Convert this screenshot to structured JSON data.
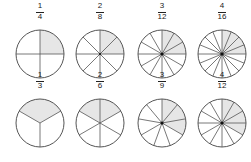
{
  "colors": {
    "line": "#555555",
    "shade": "#e6e6e6",
    "background": "#ffffff"
  },
  "figures": [
    {
      "numerator": "1",
      "denominator": "4",
      "parts": 4,
      "shaded": 1,
      "offset": 0
    },
    {
      "numerator": "2",
      "denominator": "8",
      "parts": 8,
      "shaded": 2,
      "offset": 0
    },
    {
      "numerator": "3",
      "denominator": "12",
      "parts": 12,
      "shaded": 3,
      "offset": 0
    },
    {
      "numerator": "4",
      "denominator": "16",
      "parts": 16,
      "shaded": 4,
      "offset": 0
    },
    {
      "numerator": "1",
      "denominator": "3",
      "parts": 3,
      "shaded": 1,
      "offset": -60
    },
    {
      "numerator": "2",
      "denominator": "6",
      "parts": 6,
      "shaded": 2,
      "offset": -60
    },
    {
      "numerator": "3",
      "denominator": "9",
      "parts": 9,
      "shaded": 3,
      "offset": 0
    },
    {
      "numerator": "4",
      "denominator": "12",
      "parts": 12,
      "shaded": 4,
      "offset": 0
    }
  ]
}
